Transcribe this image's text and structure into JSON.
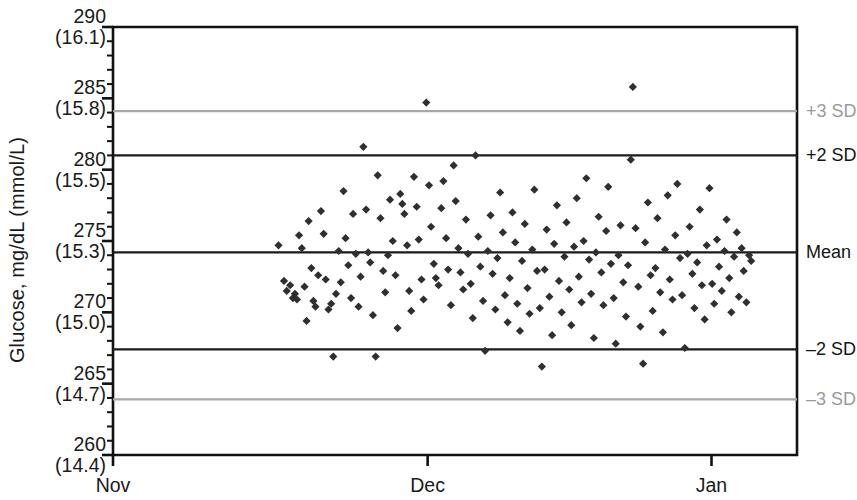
{
  "chart_data": {
    "type": "scatter",
    "title": "",
    "subtitle": "",
    "xlabel": "",
    "ylabel": "Glucose, mg/dL (mmol/L)",
    "xlim": [
      0,
      100
    ],
    "ylim": [
      260,
      290
    ],
    "grid": false,
    "legend_position": "right",
    "x_tick_labels": [
      "Nov",
      "Dec",
      "Jan"
    ],
    "x_tick_positions": [
      0,
      46.0,
      87.5
    ],
    "y_ticks": [
      {
        "mgdl": "290",
        "mmol": "(16.1)",
        "value": 290
      },
      {
        "mgdl": "285",
        "mmol": "(15.8)",
        "value": 285
      },
      {
        "mgdl": "280",
        "mmol": "(15.5)",
        "value": 280
      },
      {
        "mgdl": "275",
        "mmol": "(15.3)",
        "value": 275
      },
      {
        "mgdl": "270",
        "mmol": "(15.0)",
        "value": 270
      },
      {
        "mgdl": "265",
        "mmol": "(14.7)",
        "value": 265
      },
      {
        "mgdl": "260",
        "mmol": "(14.4)",
        "value": 260
      }
    ],
    "y_minor_tick_step": 1,
    "reference_lines": [
      {
        "label": "+3 SD",
        "value": 284.1,
        "color": "#a8a8a8",
        "width": 2.2
      },
      {
        "label": "+2 SD",
        "value": 281.0,
        "color": "#1a1a1a",
        "width": 2.2
      },
      {
        "label": "Mean",
        "value": 274.2,
        "color": "#1a1a1a",
        "width": 2.2
      },
      {
        "label": "–2 SD",
        "value": 267.4,
        "color": "#1a1a1a",
        "width": 2.2
      },
      {
        "label": "–3 SD",
        "value": 263.9,
        "color": "#a8a8a8",
        "width": 2.2
      }
    ],
    "marker": {
      "shape": "diamond",
      "size": 7,
      "color": "#2f2f2f"
    },
    "series": [
      {
        "name": "Glucose QC",
        "points": [
          [
            24.2,
            274.7
          ],
          [
            25.0,
            272.2
          ],
          [
            25.4,
            271.5
          ],
          [
            25.9,
            271.9
          ],
          [
            26.3,
            271.0
          ],
          [
            26.6,
            271.3
          ],
          [
            26.9,
            270.9
          ],
          [
            27.2,
            275.4
          ],
          [
            27.6,
            274.5
          ],
          [
            28.0,
            271.8
          ],
          [
            28.3,
            269.4
          ],
          [
            28.6,
            276.4
          ],
          [
            29.0,
            273.1
          ],
          [
            29.3,
            270.8
          ],
          [
            29.6,
            270.4
          ],
          [
            30.0,
            272.6
          ],
          [
            30.4,
            277.1
          ],
          [
            30.8,
            275.5
          ],
          [
            31.1,
            272.3
          ],
          [
            31.5,
            270.2
          ],
          [
            31.9,
            270.6
          ],
          [
            32.2,
            266.9
          ],
          [
            32.6,
            271.3
          ],
          [
            33.0,
            274.3
          ],
          [
            33.3,
            272.1
          ],
          [
            33.7,
            278.5
          ],
          [
            34.0,
            275.2
          ],
          [
            34.4,
            273.3
          ],
          [
            34.8,
            271.0
          ],
          [
            35.1,
            276.9
          ],
          [
            35.5,
            274.1
          ],
          [
            35.9,
            270.4
          ],
          [
            36.2,
            272.5
          ],
          [
            36.6,
            281.6
          ],
          [
            37.0,
            277.2
          ],
          [
            37.3,
            274.2
          ],
          [
            37.6,
            273.5
          ],
          [
            38.0,
            269.8
          ],
          [
            38.4,
            266.9
          ],
          [
            38.7,
            279.6
          ],
          [
            39.1,
            276.6
          ],
          [
            39.5,
            272.9
          ],
          [
            39.8,
            271.4
          ],
          [
            40.2,
            274.0
          ],
          [
            40.5,
            277.9
          ],
          [
            40.9,
            275.0
          ],
          [
            41.3,
            272.6
          ],
          [
            41.6,
            268.9
          ],
          [
            42.0,
            278.3
          ],
          [
            42.3,
            277.6
          ],
          [
            42.6,
            276.9
          ],
          [
            43.0,
            274.7
          ],
          [
            43.3,
            271.5
          ],
          [
            43.6,
            270.1
          ],
          [
            44.0,
            279.5
          ],
          [
            44.4,
            277.4
          ],
          [
            44.7,
            275.1
          ],
          [
            45.1,
            272.3
          ],
          [
            45.4,
            270.9
          ],
          [
            45.8,
            284.7
          ],
          [
            46.2,
            278.9
          ],
          [
            46.5,
            276.0
          ],
          [
            46.9,
            273.4
          ],
          [
            47.2,
            272.4
          ],
          [
            47.6,
            271.9
          ],
          [
            48.0,
            277.3
          ],
          [
            48.3,
            279.2
          ],
          [
            48.7,
            275.2
          ],
          [
            49.0,
            273.0
          ],
          [
            49.4,
            270.5
          ],
          [
            49.8,
            280.3
          ],
          [
            50.1,
            277.8
          ],
          [
            50.5,
            274.5
          ],
          [
            50.8,
            272.8
          ],
          [
            51.2,
            271.6
          ],
          [
            51.6,
            276.5
          ],
          [
            51.9,
            274.1
          ],
          [
            52.3,
            272.0
          ],
          [
            52.6,
            269.6
          ],
          [
            53.0,
            281.0
          ],
          [
            53.4,
            275.3
          ],
          [
            53.7,
            273.2
          ],
          [
            54.1,
            270.8
          ],
          [
            54.4,
            267.3
          ],
          [
            54.8,
            274.3
          ],
          [
            55.2,
            276.8
          ],
          [
            55.5,
            272.7
          ],
          [
            55.9,
            270.2
          ],
          [
            56.2,
            273.8
          ],
          [
            56.6,
            278.4
          ],
          [
            57.0,
            275.6
          ],
          [
            57.3,
            271.2
          ],
          [
            57.7,
            269.3
          ],
          [
            58.0,
            272.4
          ],
          [
            58.4,
            277.0
          ],
          [
            58.8,
            274.9
          ],
          [
            59.1,
            270.6
          ],
          [
            59.5,
            268.7
          ],
          [
            59.8,
            273.6
          ],
          [
            60.2,
            276.2
          ],
          [
            60.6,
            271.7
          ],
          [
            60.9,
            269.9
          ],
          [
            61.3,
            274.4
          ],
          [
            61.6,
            278.6
          ],
          [
            62.0,
            272.9
          ],
          [
            62.4,
            270.3
          ],
          [
            62.7,
            266.2
          ],
          [
            63.1,
            273.0
          ],
          [
            63.4,
            275.8
          ],
          [
            63.8,
            271.1
          ],
          [
            64.2,
            268.4
          ],
          [
            64.5,
            274.8
          ],
          [
            64.9,
            277.5
          ],
          [
            65.2,
            272.2
          ],
          [
            65.6,
            270.0
          ],
          [
            66.0,
            273.9
          ],
          [
            66.3,
            276.3
          ],
          [
            66.7,
            271.6
          ],
          [
            67.0,
            269.1
          ],
          [
            67.4,
            274.6
          ],
          [
            67.8,
            278.0
          ],
          [
            68.1,
            272.5
          ],
          [
            68.5,
            270.7
          ],
          [
            68.8,
            275.0
          ],
          [
            69.2,
            279.4
          ],
          [
            69.6,
            273.7
          ],
          [
            69.9,
            271.3
          ],
          [
            70.3,
            268.2
          ],
          [
            70.6,
            274.2
          ],
          [
            71.0,
            276.7
          ],
          [
            71.4,
            272.8
          ],
          [
            71.7,
            270.5
          ],
          [
            72.1,
            275.7
          ],
          [
            72.4,
            278.8
          ],
          [
            72.8,
            273.4
          ],
          [
            73.2,
            271.0
          ],
          [
            73.5,
            267.8
          ],
          [
            73.9,
            274.0
          ],
          [
            74.2,
            276.1
          ],
          [
            74.6,
            272.1
          ],
          [
            75.0,
            269.7
          ],
          [
            75.3,
            273.3
          ],
          [
            75.7,
            280.7
          ],
          [
            76.0,
            285.8
          ],
          [
            76.4,
            275.9
          ],
          [
            76.8,
            271.8
          ],
          [
            77.1,
            269.0
          ],
          [
            77.5,
            266.4
          ],
          [
            77.8,
            274.9
          ],
          [
            78.2,
            277.7
          ],
          [
            78.6,
            272.6
          ],
          [
            78.9,
            270.1
          ],
          [
            79.3,
            273.1
          ],
          [
            79.6,
            276.6
          ],
          [
            80.0,
            271.4
          ],
          [
            80.4,
            268.6
          ],
          [
            80.7,
            274.4
          ],
          [
            81.1,
            278.2
          ],
          [
            81.4,
            272.3
          ],
          [
            81.8,
            270.9
          ],
          [
            82.2,
            275.4
          ],
          [
            82.5,
            279.0
          ],
          [
            82.9,
            273.8
          ],
          [
            83.2,
            271.2
          ],
          [
            83.6,
            267.5
          ],
          [
            84.0,
            274.1
          ],
          [
            84.3,
            276.0
          ],
          [
            84.7,
            272.7
          ],
          [
            85.0,
            270.3
          ],
          [
            85.4,
            273.5
          ],
          [
            85.8,
            277.2
          ],
          [
            86.1,
            271.9
          ],
          [
            86.5,
            269.5
          ],
          [
            86.8,
            274.7
          ],
          [
            87.2,
            278.7
          ],
          [
            87.6,
            272.0
          ],
          [
            87.9,
            270.6
          ],
          [
            88.3,
            275.1
          ],
          [
            88.6,
            273.2
          ],
          [
            89.0,
            271.5
          ],
          [
            89.4,
            274.3
          ],
          [
            89.7,
            276.5
          ],
          [
            90.1,
            272.4
          ],
          [
            90.4,
            270.0
          ],
          [
            90.8,
            273.9
          ],
          [
            91.2,
            275.6
          ],
          [
            91.5,
            271.1
          ],
          [
            91.9,
            274.5
          ],
          [
            92.2,
            272.9
          ],
          [
            92.6,
            270.7
          ],
          [
            93.0,
            274.0
          ],
          [
            93.3,
            273.6
          ]
        ]
      }
    ]
  }
}
